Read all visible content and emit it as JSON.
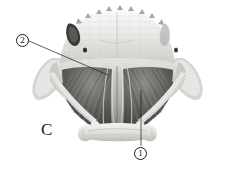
{
  "figure": {
    "panel_letter": "C",
    "background_color": "#ffffff",
    "width": 235,
    "height": 173,
    "rendering": "grayscale-halftone-photograph"
  },
  "callouts": [
    {
      "id": "callout-1",
      "label": "①",
      "number": "1",
      "leader": {
        "type": "vertical-line",
        "from_x": 141,
        "from_y": 90,
        "to_x": 141,
        "to_y": 146
      },
      "color": "#1a1a1a"
    },
    {
      "id": "callout-2",
      "label": "②",
      "number": "2",
      "leader": {
        "type": "diagonal-line",
        "from_x": 29,
        "from_y": 41,
        "to_x": 108,
        "to_y": 75
      },
      "color": "#1a1a1a"
    }
  ],
  "palette": {
    "background": "#ffffff",
    "bone_light": "#e9e8e6",
    "bone_mid": "#d2d0cd",
    "bone_shadow": "#b0aeab",
    "muscle_dark": "#4a4845",
    "muscle_mid": "#6f6d6a",
    "muscle_light": "#9b9996",
    "cavity_black": "#2a2927",
    "line_color": "#1a1a1a",
    "tendon_pale": "#f2f1ef"
  },
  "anatomy_regions": [
    {
      "name": "cranial-arch-superior",
      "description": "broad pale dome with serrated crest along upper margin"
    },
    {
      "name": "crest-serrations",
      "description": "row of small triangular bumps along the superior arch"
    },
    {
      "name": "temporal-fossa-left",
      "description": "dark notch cavity upper left of the arch"
    },
    {
      "name": "foramen-left",
      "description": "small dark oval opening on left side of the pale plate"
    },
    {
      "name": "foramen-right",
      "description": "small dark oval opening on right side of the pale plate"
    },
    {
      "name": "zygomatic-process-left",
      "description": "lateral pale projection to the left"
    },
    {
      "name": "zygomatic-process-right",
      "description": "lateral pale projection to the right"
    },
    {
      "name": "muscle-mass-left",
      "description": "dark striated muscle fan on the left half"
    },
    {
      "name": "muscle-mass-right",
      "description": "dark striated muscle fan on the right half"
    },
    {
      "name": "median-raphe",
      "description": "pale vertical midline band separating left and right muscle fans"
    },
    {
      "name": "hyoid-body",
      "description": "pale transverse bone bar across the lower centre"
    },
    {
      "name": "hyoid-horn-left",
      "description": "pale hook-shaped process at the left end of the hyoid bar"
    },
    {
      "name": "hyoid-horn-right",
      "description": "pale hook-shaped process at the right end of the hyoid bar"
    },
    {
      "name": "stylohyal-strut-left",
      "description": "slender pale strut running from left lateral margin down to the hyoid"
    },
    {
      "name": "stylohyal-strut-right",
      "description": "slender pale strut running from right lateral margin down to the hyoid"
    }
  ]
}
